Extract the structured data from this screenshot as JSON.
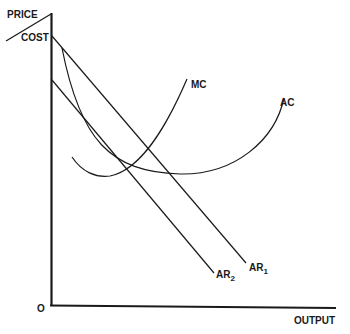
{
  "diagram": {
    "type": "economics-cost-revenue",
    "axes": {
      "y_label_top": "PRICE",
      "y_label_bottom": "COST",
      "x_label": "OUTPUT",
      "origin_label": "O"
    },
    "curves": {
      "mc": {
        "label": "MC"
      },
      "ac": {
        "label": "AC"
      },
      "ar1": {
        "label": "AR",
        "subscript": "1"
      },
      "ar2": {
        "label": "AR",
        "subscript": "2"
      }
    },
    "colors": {
      "line": "#1a1a1a",
      "background": "#ffffff"
    }
  }
}
